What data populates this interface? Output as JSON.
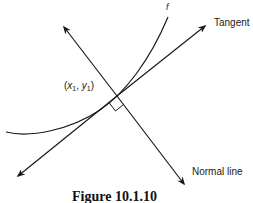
{
  "figure": {
    "curve_label": "f",
    "tangent_label": "Tangent",
    "normal_label": "Normal line",
    "point_label": {
      "open": "(",
      "x_var": "x",
      "x_sub": "1",
      "sep": ", ",
      "y_var": "y",
      "y_sub": "1",
      "close": ")"
    },
    "caption": "Figure 10.1.10",
    "stroke_color": "#1a1a1a",
    "background_color": "#ffffff"
  }
}
